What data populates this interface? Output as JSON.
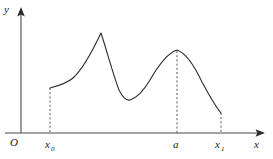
{
  "figure": {
    "background_color": "#ffffff",
    "curve_color": "#2b2b2b",
    "axis_color": "#4a4a4a",
    "dash_color": "#555555",
    "width": 273,
    "height": 159
  },
  "labels": {
    "y_axis": "y",
    "x_axis": "x",
    "origin": "O",
    "x0_base": "x",
    "x0_sub": "0",
    "a": "a",
    "x1_base": "x",
    "x1_sub": "1"
  },
  "chart_data": {
    "type": "line",
    "title": "",
    "xlabel": "x",
    "ylabel": "y",
    "grid": false,
    "legend": false,
    "axis_origin_label": "O",
    "x_tick_labels": [
      "x0",
      "a",
      "x1"
    ],
    "x_tick_pixels": [
      50,
      177,
      221
    ],
    "annotations": [
      {
        "label": "x0",
        "kind": "dashed-vertical",
        "x_px": 50,
        "y_top_px": 88,
        "y_bottom_px": 133
      },
      {
        "label": "a",
        "kind": "dashed-vertical",
        "x_px": 177,
        "y_top_px": 51,
        "y_bottom_px": 133
      },
      {
        "label": "x1",
        "kind": "dashed-vertical",
        "x_px": 221,
        "y_top_px": 113,
        "y_bottom_px": 133
      }
    ],
    "features": [
      {
        "name": "left-endpoint",
        "x_px": 50,
        "y_px": 88
      },
      {
        "name": "cusp-maximum",
        "x_px": 101,
        "y_px": 33
      },
      {
        "name": "local-minimum",
        "x_px": 128,
        "y_px": 101
      },
      {
        "name": "smooth-maximum",
        "x_px": 177,
        "y_px": 50
      },
      {
        "name": "right-endpoint",
        "x_px": 221,
        "y_px": 113
      }
    ],
    "series": [
      {
        "name": "f(x)",
        "path": "M 50,88 C 58,86 66,84 73,78 C 82,70 92,52 101,33 C 106,48 113,74 119,90 C 123,98 126,101 130,100 C 137,98 144,90 150,80 C 158,66 168,53 177,50 C 186,53 194,65 202,82 C 209,95 216,107 221,113"
      }
    ]
  }
}
